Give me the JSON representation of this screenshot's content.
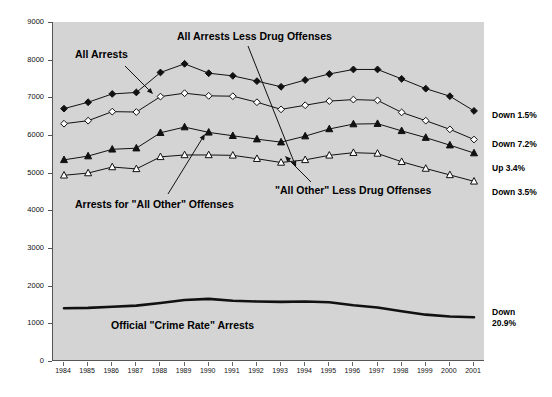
{
  "chart_data": {
    "type": "line",
    "title": "",
    "xlabel": "",
    "ylabel": "Per 100,000 Population 18 or Older",
    "ylim": [
      0,
      9000
    ],
    "ytick_step": 1000,
    "yticks": [
      "0",
      "1000",
      "2000",
      "3000",
      "4000",
      "5000",
      "6000",
      "7000",
      "8000",
      "9000"
    ],
    "grid": false,
    "legend_position": "inline-annotations",
    "categories": [
      "1984",
      "1985",
      "1986",
      "1987",
      "1988",
      "1989",
      "1990",
      "1991",
      "1992",
      "1993",
      "1994",
      "1995",
      "1996",
      "1997",
      "1998",
      "1999",
      "2000",
      "2001"
    ],
    "series": [
      {
        "name": "All Arrests",
        "marker": "filled-diamond",
        "values": [
          6700,
          6870,
          7090,
          7130,
          7660,
          7890,
          7640,
          7570,
          7430,
          7280,
          7460,
          7620,
          7740,
          7740,
          7490,
          7230,
          7030,
          6640
        ]
      },
      {
        "name": "All Arrests Less Drug Offenses",
        "marker": "open-diamond",
        "values": [
          6300,
          6380,
          6620,
          6610,
          7020,
          7110,
          7040,
          7030,
          6870,
          6680,
          6790,
          6900,
          6940,
          6920,
          6600,
          6380,
          6150,
          5880
        ]
      },
      {
        "name": "Arrests for \"All Other\" Offenses",
        "marker": "filled-triangle",
        "values": [
          5340,
          5440,
          5620,
          5650,
          6060,
          6210,
          6070,
          5980,
          5890,
          5810,
          5970,
          6160,
          6290,
          6300,
          6110,
          5930,
          5730,
          5520
        ]
      },
      {
        "name": "\"All Other\" Less Drug Offenses",
        "marker": "open-triangle",
        "values": [
          4930,
          4990,
          5150,
          5100,
          5420,
          5470,
          5470,
          5460,
          5370,
          5270,
          5340,
          5460,
          5530,
          5510,
          5290,
          5110,
          4940,
          4770
        ]
      },
      {
        "name": "Official \"Crime Rate\" Arrests",
        "marker": "none",
        "values": [
          1400,
          1410,
          1440,
          1470,
          1540,
          1620,
          1650,
          1600,
          1580,
          1570,
          1580,
          1560,
          1480,
          1420,
          1320,
          1230,
          1180,
          1160
        ]
      }
    ],
    "annotations": [
      {
        "id": "all-arrests",
        "text": "All Arrests"
      },
      {
        "id": "all-arrests-less-drug",
        "text": "All Arrests Less Drug Offenses"
      },
      {
        "id": "all-other-offenses",
        "text": "Arrests for \"All Other\" Offenses"
      },
      {
        "id": "all-other-less-drug",
        "text": "\"All Other\" Less Drug Offenses"
      },
      {
        "id": "crime-rate",
        "text": "Official \"Crime Rate\" Arrests"
      }
    ],
    "end_change_labels": [
      {
        "id": "all-arrests-change",
        "text": "Down 1.5%"
      },
      {
        "id": "all-arrests-less-drug-change",
        "text": "Down 7.2%"
      },
      {
        "id": "all-other-offenses-change",
        "text": "Up 3.4%"
      },
      {
        "id": "all-other-less-drug-change",
        "text": "Down 3.5%"
      },
      {
        "id": "crime-rate-change-line1",
        "text": "Down"
      },
      {
        "id": "crime-rate-change-line2",
        "text": "20.9%"
      }
    ],
    "colors": {
      "plot_background": "#d4d4d4",
      "page_background": "#ffffff",
      "line": "#111111",
      "axis": "#555555",
      "text": "#111111"
    }
  }
}
